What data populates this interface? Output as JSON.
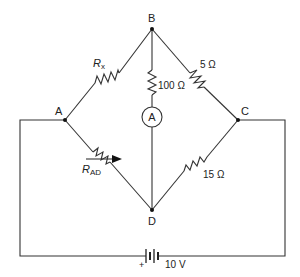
{
  "diagram": {
    "type": "wheatstone-bridge-circuit",
    "nodes": {
      "A": "A",
      "B": "B",
      "C": "C",
      "D": "D"
    },
    "components": {
      "rx": {
        "label_main": "R",
        "label_sub": "x",
        "between": "A-B"
      },
      "r_bc": {
        "label": "5 Ω",
        "between": "B-C"
      },
      "r_bd": {
        "label": "100 Ω",
        "between": "B-D"
      },
      "ammeter": {
        "label": "A",
        "between": "B-D"
      },
      "r_ad": {
        "label_main": "R",
        "label_sub": "AD",
        "between": "A-D",
        "variable": true
      },
      "r_cd": {
        "label": "15 Ω",
        "between": "C-D"
      },
      "battery": {
        "label": "10 V",
        "polarity_mark": "+"
      }
    }
  }
}
